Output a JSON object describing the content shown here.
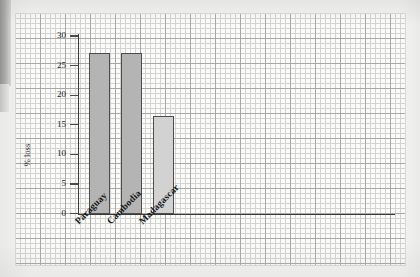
{
  "figure": {
    "kind": "scanned-graph-paper-bar-chart",
    "paper": "graph paper with 5 mm minor grid and 25 mm major grid"
  },
  "chart_data": {
    "type": "bar",
    "title": "",
    "xlabel": "",
    "ylabel": "% loss",
    "categories": [
      "Paraguay",
      "Cambodia",
      "Madagascar"
    ],
    "values": [
      27.2,
      27.2,
      16.5
    ],
    "ylim": [
      0,
      30
    ],
    "yticks": [
      0,
      5,
      10,
      15,
      20,
      25,
      30
    ],
    "ytick_labels": [
      "0",
      "5",
      "10",
      "15",
      "20",
      "25",
      "30"
    ],
    "grid": true,
    "legend": false,
    "bar_colors": [
      "#b4b4b4",
      "#b4b4b4",
      "#d2d2d2"
    ],
    "bar_edge_color": "#4d4d4d",
    "axis_color": "#3a3a3a"
  },
  "style": {
    "paper_bg": "#fbfbfa",
    "page_bg": "#f4f4f2",
    "grid_minor": "#d3d3d1",
    "grid_major": "#a8a8a8",
    "ink": "#1d1d1d"
  }
}
